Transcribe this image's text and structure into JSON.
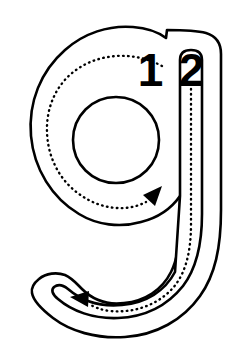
{
  "worksheet": {
    "type": "letter-tracing-practice",
    "letter": "g",
    "letter_case": "lowercase",
    "background_color": "#ffffff",
    "outline_color": "#000000",
    "guide_color": "#000000",
    "number_color": "#000000",
    "stroke_order": [
      {
        "number": "1",
        "label": "1",
        "description": "bowl-counterclockwise",
        "arrow_direction": "up-right",
        "guide_style": "dotted"
      },
      {
        "number": "2",
        "label": "2",
        "description": "descender-stem-and-tail",
        "arrow_direction": "left",
        "guide_style": "dotted"
      }
    ],
    "canvas": {
      "width": 237,
      "height": 361
    }
  }
}
